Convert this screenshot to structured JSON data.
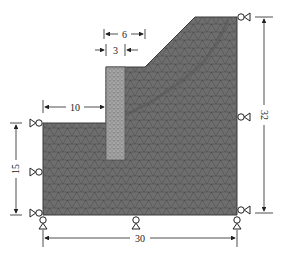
{
  "figure": {
    "colors": {
      "soil": "#6e6e6e",
      "soil_mesh": "#4a4a4a",
      "pile": "#a9a9a9",
      "pile_mesh": "#6a6a6a",
      "dimension": "#222222"
    },
    "dimensions": {
      "top_offset": "6",
      "pile_width": "3",
      "left_berm": "10",
      "left_height": "15",
      "right_height": "32",
      "base_width": "30"
    },
    "supports": {
      "left": [
        "roller-left-top",
        "roller-left-mid",
        "roller-left-bottom"
      ],
      "right": [
        "roller-right-top",
        "roller-right-mid",
        "roller-right-bottom"
      ],
      "bottom": [
        "roller-bottom-left",
        "roller-bottom-mid",
        "roller-bottom-right"
      ]
    }
  }
}
